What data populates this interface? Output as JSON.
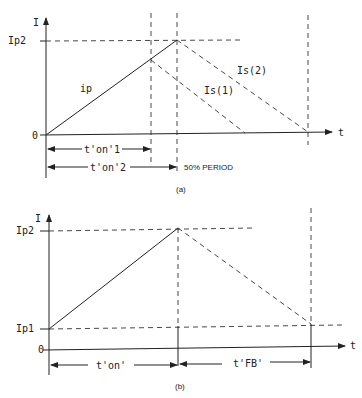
{
  "panel_a": {
    "caption": "(a)",
    "y_axis_label": "I",
    "x_axis_label": "t",
    "ticks": {
      "ip2": "Ip2",
      "zero": "0"
    },
    "curves": {
      "primary": "ip",
      "secondary_1": "Is(1)",
      "secondary_2": "Is(2)"
    },
    "dimensions": {
      "ton1": "t'on'1",
      "ton2": "t'on'2"
    },
    "annotation": "50% PERIOD"
  },
  "panel_b": {
    "caption": "(b)",
    "y_axis_label": "I",
    "x_axis_label": "t",
    "ticks": {
      "ip2": "Ip2",
      "ip1": "Ip1",
      "zero": "0"
    },
    "dimensions": {
      "ton": "t'on'",
      "tfb": "t'FB'"
    }
  }
}
